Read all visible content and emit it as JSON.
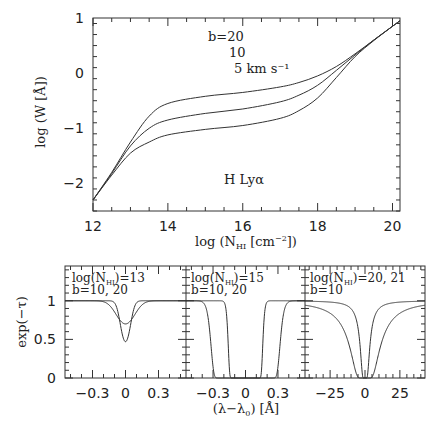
{
  "chart_data": [
    {
      "type": "line",
      "title": "",
      "xlabel": "log (N_HI [cm^-2])",
      "ylabel": "log (W [Å])",
      "xlim": [
        12,
        20.2
      ],
      "ylim": [
        -2.5,
        1
      ],
      "xticks": [
        12,
        14,
        16,
        18,
        20
      ],
      "yticks": [
        1,
        0,
        -1,
        -2
      ],
      "annotations": {
        "b_label_1": "b=20",
        "b_label_2": "10",
        "b_label_3": "5 km s⁻¹",
        "line_label": "H Lyα"
      },
      "x": [
        12,
        12.5,
        13,
        13.5,
        14,
        15,
        16,
        17,
        17.5,
        18,
        18.5,
        19,
        19.5,
        20,
        20.2
      ],
      "series": [
        {
          "name": "b=20",
          "values": [
            -2.3,
            -1.8,
            -1.25,
            -0.78,
            -0.55,
            -0.42,
            -0.35,
            -0.25,
            -0.17,
            -0.05,
            0.12,
            0.35,
            0.6,
            0.85,
            0.95
          ]
        },
        {
          "name": "b=10",
          "values": [
            -2.3,
            -1.82,
            -1.32,
            -1.0,
            -0.85,
            -0.73,
            -0.65,
            -0.52,
            -0.4,
            -0.22,
            0.05,
            0.33,
            0.6,
            0.85,
            0.95
          ]
        },
        {
          "name": "b=5",
          "values": [
            -2.3,
            -1.85,
            -1.45,
            -1.25,
            -1.12,
            -1.02,
            -0.95,
            -0.82,
            -0.68,
            -0.45,
            -0.08,
            0.3,
            0.59,
            0.85,
            0.95
          ]
        }
      ]
    },
    {
      "type": "line",
      "panel": "logN=13",
      "annotation_1": "log(N_HI)=13",
      "annotation_2": "b=10, 20",
      "xlabel": "",
      "ylabel": "exp(−τ)",
      "xlim": [
        -0.55,
        0.55
      ],
      "ylim": [
        0,
        1.45
      ],
      "xticks": [
        -0.3,
        0,
        0.3
      ],
      "xtick_labels": [
        "−0.3",
        "0",
        "0.3"
      ],
      "yticks": [
        0,
        0.5,
        1
      ],
      "ytick_labels": [
        "0",
        "0.5",
        "1"
      ],
      "log_N": 13,
      "series": [
        {
          "name": "b=10",
          "b": 10,
          "min_value": 0.47
        },
        {
          "name": "b=20",
          "b": 20,
          "min_value": 0.7
        }
      ]
    },
    {
      "type": "line",
      "panel": "logN=15",
      "annotation_1": "log(N_HI)=15",
      "annotation_2": "b=10, 20",
      "xlabel": "(λ−λ₀) [Å]",
      "xlim": [
        -0.55,
        0.55
      ],
      "ylim": [
        0,
        1.45
      ],
      "xticks": [
        -0.3,
        0,
        0.3
      ],
      "xtick_labels": [
        "−0.3",
        "0",
        "0.3"
      ],
      "log_N": 15,
      "series": [
        {
          "name": "b=10",
          "b": 10,
          "half_width": 0.1
        },
        {
          "name": "b=20",
          "b": 20,
          "half_width": 0.17
        }
      ]
    },
    {
      "type": "line",
      "panel": "logN=20,21",
      "annotation_1": "log(N_HI)=20, 21",
      "annotation_2": "b=10",
      "xlim": [
        -43,
        43
      ],
      "ylim": [
        0,
        1.45
      ],
      "xticks": [
        -25,
        0,
        25
      ],
      "xtick_labels": [
        "−25",
        "0",
        "25"
      ],
      "series": [
        {
          "name": "logN=20",
          "log_N": 20,
          "b": 10
        },
        {
          "name": "logN=21",
          "log_N": 21,
          "b": 10
        }
      ]
    }
  ]
}
